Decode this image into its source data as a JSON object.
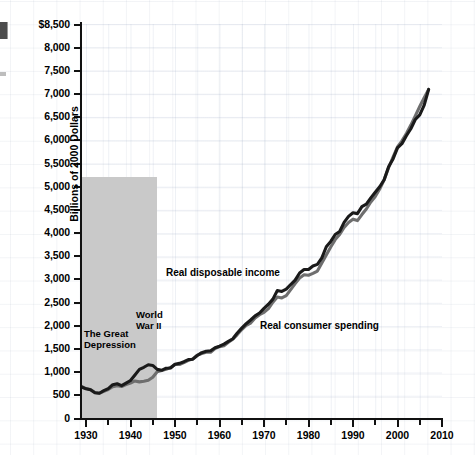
{
  "chart_data": {
    "type": "line",
    "title": "",
    "xlabel": "",
    "ylabel": "Billions of 2000 Dollars",
    "ylim": [
      0,
      8500
    ],
    "xlim": [
      1929,
      2010
    ],
    "grid": true,
    "legend": "inline-annotations",
    "ytick_labels": [
      "$8,500",
      "8,000",
      "7,500",
      "7,000",
      "6,500",
      "6,000",
      "5,500",
      "5,000",
      "4,500",
      "4,000",
      "3,500",
      "3,000",
      "2,500",
      "2,000",
      "1,500",
      "1,000",
      "500",
      "0"
    ],
    "ytick_values": [
      8500,
      8000,
      7500,
      7000,
      6500,
      6000,
      5500,
      5000,
      4500,
      4000,
      3500,
      3000,
      2500,
      2000,
      1500,
      1000,
      500,
      0
    ],
    "xtick_labels": [
      "1930",
      "1940",
      "1950",
      "1960",
      "1970",
      "1980",
      "1990",
      "2000",
      "2010"
    ],
    "xtick_values": [
      1930,
      1940,
      1950,
      1960,
      1970,
      1980,
      1990,
      2000,
      2010
    ],
    "xtick_minor_values": [
      1935,
      1945,
      1955,
      1965,
      1975,
      1985,
      1995,
      2005
    ],
    "series": [
      {
        "name": "Real disposable income",
        "color": "#1a1a1a",
        "x": [
          1929,
          1930,
          1931,
          1932,
          1933,
          1934,
          1935,
          1936,
          1937,
          1938,
          1939,
          1940,
          1941,
          1942,
          1943,
          1944,
          1945,
          1946,
          1947,
          1948,
          1949,
          1950,
          1951,
          1952,
          1953,
          1954,
          1955,
          1956,
          1957,
          1958,
          1959,
          1960,
          1961,
          1962,
          1963,
          1964,
          1965,
          1966,
          1967,
          1968,
          1969,
          1970,
          1971,
          1972,
          1973,
          1974,
          1975,
          1976,
          1977,
          1978,
          1979,
          1980,
          1981,
          1982,
          1983,
          1984,
          1985,
          1986,
          1987,
          1988,
          1989,
          1990,
          1991,
          1992,
          1993,
          1994,
          1995,
          1996,
          1997,
          1998,
          1999,
          2000,
          2001,
          2002,
          2003,
          2004,
          2005,
          2006,
          2007
        ],
        "y": [
          680,
          640,
          620,
          555,
          545,
          600,
          645,
          730,
          750,
          710,
          765,
          820,
          940,
          1060,
          1105,
          1160,
          1145,
          1060,
          1040,
          1085,
          1090,
          1170,
          1190,
          1225,
          1270,
          1280,
          1360,
          1420,
          1450,
          1460,
          1525,
          1560,
          1605,
          1665,
          1720,
          1845,
          1950,
          2045,
          2125,
          2215,
          2275,
          2375,
          2465,
          2575,
          2760,
          2740,
          2790,
          2890,
          2985,
          3140,
          3215,
          3215,
          3290,
          3325,
          3465,
          3705,
          3820,
          3970,
          4035,
          4230,
          4360,
          4440,
          4420,
          4570,
          4625,
          4760,
          4880,
          5000,
          5150,
          5430,
          5600,
          5840,
          5930,
          6100,
          6250,
          6450,
          6550,
          6760,
          7100
        ],
        "final_value_approx": 8300
      },
      {
        "name": "Real consumer spending",
        "color": "#6e6e6e",
        "x": [
          1929,
          1930,
          1931,
          1932,
          1933,
          1934,
          1935,
          1936,
          1937,
          1938,
          1939,
          1940,
          1941,
          1942,
          1943,
          1944,
          1945,
          1946,
          1947,
          1948,
          1949,
          1950,
          1951,
          1952,
          1953,
          1954,
          1955,
          1956,
          1957,
          1958,
          1959,
          1960,
          1961,
          1962,
          1963,
          1964,
          1965,
          1966,
          1967,
          1968,
          1969,
          1970,
          1971,
          1972,
          1973,
          1974,
          1975,
          1976,
          1977,
          1978,
          1979,
          1980,
          1981,
          1982,
          1983,
          1984,
          1985,
          1986,
          1987,
          1988,
          1989,
          1990,
          1991,
          1992,
          1993,
          1994,
          1995,
          1996,
          1997,
          1998,
          1999,
          2000,
          2001,
          2002,
          2003,
          2004,
          2005,
          2006,
          2007
        ],
        "y": [
          690,
          645,
          625,
          560,
          545,
          585,
          625,
          685,
          705,
          690,
          730,
          765,
          810,
          790,
          805,
          825,
          890,
          1010,
          1035,
          1060,
          1100,
          1165,
          1165,
          1205,
          1255,
          1285,
          1365,
          1400,
          1430,
          1430,
          1510,
          1550,
          1570,
          1645,
          1710,
          1810,
          1920,
          2010,
          2060,
          2170,
          2240,
          2290,
          2370,
          2510,
          2620,
          2600,
          2650,
          2780,
          2910,
          3030,
          3100,
          3090,
          3130,
          3180,
          3355,
          3525,
          3700,
          3860,
          3970,
          4120,
          4230,
          4300,
          4270,
          4400,
          4520,
          4670,
          4790,
          4950,
          5150,
          5410,
          5640,
          5860,
          5990,
          6150,
          6330,
          6530,
          6730,
          6920,
          7100
        ],
        "final_value_approx": 8050
      }
    ],
    "shaded_bands": [
      {
        "label": "The Great\nDepression",
        "start": 1929,
        "end": 1940,
        "color": "#c9c9c9",
        "top_value": 5200
      },
      {
        "label": "World\nWar II",
        "start": 1941,
        "end": 1945,
        "color": "#c9c9c9",
        "top_value": 5200
      }
    ],
    "annotations": [
      {
        "text": "Real disposable income",
        "x": 1961,
        "y": 2850
      },
      {
        "text": "Real consumer spending",
        "x": 1973,
        "y": 1820
      }
    ]
  }
}
